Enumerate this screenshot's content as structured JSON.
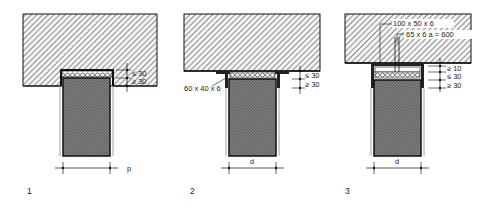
{
  "figure": {
    "colors": {
      "slab_hatch": "#555555",
      "wall_fill": "#6f6f6f",
      "line": "#111111",
      "background": "#ffffff"
    }
  },
  "details": [
    {
      "number": "1",
      "dimensions": [
        "≤ 30",
        "≥ 30"
      ],
      "width_label": "p",
      "note": "Wall recessed into ceiling slab pocket with compressible filler"
    },
    {
      "number": "2",
      "dimensions": [
        "≤ 30",
        "≥ 30"
      ],
      "width_label": "d",
      "angle_label": "60 x 40 x 6"
    },
    {
      "number": "3",
      "dimensions": [
        "≥ 10",
        "≤ 30",
        "≥ 30"
      ],
      "width_label": "d",
      "channel_label": "100 x 50 x 6",
      "anchor_label": "65 x 6 a = 600"
    }
  ]
}
